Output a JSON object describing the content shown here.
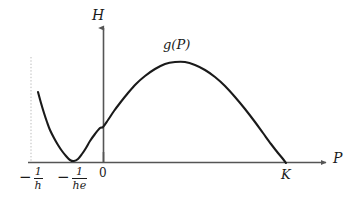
{
  "figure": {
    "kind": "mathematical-plot",
    "background_color": "#ffffff",
    "curve_color": "#1a1a1a",
    "axis_color": "#555555",
    "dotted_line_color": "#bbbbbb"
  },
  "labels": {
    "y_axis": "H",
    "x_axis": "P",
    "curve": "g(P)",
    "origin": "0",
    "carrying_capacity": "K",
    "asymptote_numerator": "1",
    "asymptote_denominator": "h",
    "minimum_numerator": "1",
    "minimum_denominator": "he",
    "minus": "−"
  },
  "chart_data": {
    "type": "line",
    "title": "",
    "xlabel": "P",
    "ylabel": "H",
    "grid": false,
    "legend": false,
    "annotations": [
      {
        "text": "g(P)",
        "x": 0.42,
        "y": 0.86,
        "note": "curve name near local maximum"
      },
      {
        "text": "K",
        "x": 0.855,
        "y": 0.0,
        "note": "right zero crossing of g(P)"
      },
      {
        "text": "0",
        "x": 0.0,
        "y": 0.0,
        "note": "origin tick"
      },
      {
        "text": "-1/he",
        "x": -0.11,
        "y": 0.0,
        "note": "tangential minimum touching axis"
      },
      {
        "text": "-1/h",
        "x": -0.24,
        "y": 0.0,
        "note": "vertical asymptote location"
      }
    ],
    "xticks": [
      -0.24,
      -0.11,
      0.0,
      0.855
    ],
    "xticklabels": [
      "−1/h",
      "−1/he",
      "0",
      "K"
    ],
    "yticks": [],
    "yticklabels": [],
    "xlim": [
      -0.28,
      0.99
    ],
    "ylim": [
      -0.05,
      1.12
    ],
    "series": [
      {
        "name": "g(P)",
        "color": "#1a1a1a",
        "points": [
          [
            38,
            92
          ],
          [
            41,
            103
          ],
          [
            44,
            113
          ],
          [
            47,
            122
          ],
          [
            50,
            130
          ],
          [
            54,
            138
          ],
          [
            58,
            145
          ],
          [
            62,
            151
          ],
          [
            66,
            156
          ],
          [
            70,
            160
          ],
          [
            74,
            161
          ],
          [
            78,
            159
          ],
          [
            82,
            154
          ],
          [
            86,
            148
          ],
          [
            90,
            141
          ],
          [
            95,
            134
          ],
          [
            100,
            128
          ],
          [
            103,
            127
          ],
          [
            108,
            120
          ],
          [
            114,
            111
          ],
          [
            120,
            103
          ],
          [
            128,
            93
          ],
          [
            136,
            84
          ],
          [
            145,
            76
          ],
          [
            155,
            69
          ],
          [
            165,
            64
          ],
          [
            175,
            62
          ],
          [
            185,
            62
          ],
          [
            195,
            65
          ],
          [
            205,
            70
          ],
          [
            215,
            77
          ],
          [
            225,
            86
          ],
          [
            235,
            97
          ],
          [
            245,
            109
          ],
          [
            255,
            122
          ],
          [
            263,
            133
          ],
          [
            271,
            144
          ],
          [
            278,
            153
          ],
          [
            283,
            159
          ],
          [
            286,
            163
          ]
        ],
        "note": "pixel-space polyline of the plotted curve g(P)"
      }
    ],
    "dotted_asymptote": {
      "x_pixel": 31,
      "y_top_pixel": 57,
      "y_bottom_pixel": 162,
      "label": "−1/h"
    },
    "axes_geometry": {
      "x_axis_y_pixel": 162,
      "x_axis_start_pixel": 28,
      "x_axis_end_pixel": 330,
      "y_axis_x_pixel": 103,
      "y_axis_top_pixel": 24,
      "y_axis_bottom_pixel": 163,
      "origin_tick_top_pixel": 152
    }
  }
}
